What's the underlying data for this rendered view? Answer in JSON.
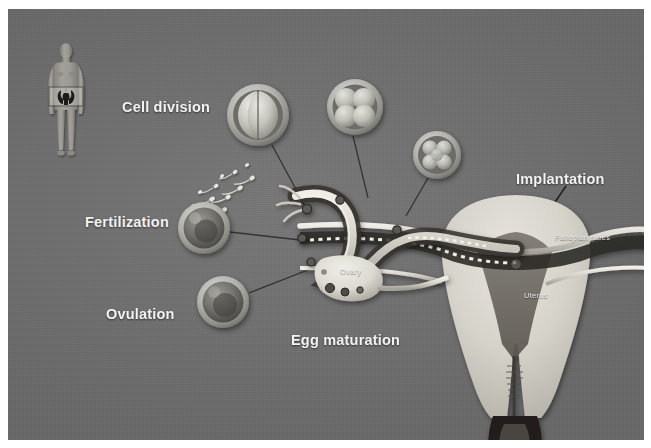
{
  "figure": {
    "background_color": "#6f6f6f",
    "label_color": "#f2f2f2",
    "border_color": "#ffffff",
    "width": 651,
    "height": 448
  },
  "labels": {
    "cell_division": "Cell division",
    "fertilization": "Fertilization",
    "ovulation": "Ovulation",
    "egg_maturation": "Egg maturation",
    "implantation": "Implantation"
  },
  "anatomy_labels": {
    "fallopian_tubes": "Fallopian tubes",
    "uterus": "Uterus",
    "ovary": "Ovary"
  },
  "stages": [
    {
      "name": "ovulation",
      "caption": "Ovulation",
      "cell_count": 1,
      "cx": 223,
      "cy": 302,
      "r": 26
    },
    {
      "name": "fertilization",
      "caption": "Fertilization",
      "cell_count": 1,
      "cx": 204,
      "cy": 228,
      "r": 26
    },
    {
      "name": "two-cell",
      "caption": "Cell division",
      "cell_count": 2,
      "cx": 258,
      "cy": 115,
      "r": 31
    },
    {
      "name": "four-cell",
      "caption": "",
      "cell_count": 4,
      "cx": 355,
      "cy": 107,
      "r": 28
    },
    {
      "name": "morula",
      "caption": "",
      "cell_count": 8,
      "cx": 437,
      "cy": 155,
      "r": 24
    },
    {
      "name": "blastocyst",
      "caption": "Implantation",
      "cell_count": 16,
      "cx": 516,
      "cy": 264,
      "r": 6
    }
  ],
  "body_icon": {
    "name": "female-body-figure",
    "highlight_box": true
  }
}
